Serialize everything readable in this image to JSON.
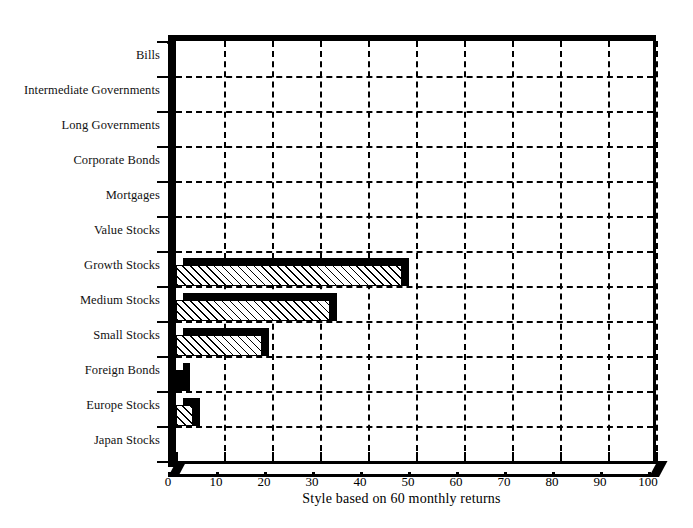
{
  "chart_data": {
    "type": "bar",
    "orientation": "horizontal",
    "title": "",
    "subtitle": "",
    "xlabel": "Style based on 60 monthly returns",
    "ylabel": "",
    "xlim": [
      0,
      100
    ],
    "xticks": [
      0,
      10,
      20,
      30,
      40,
      50,
      60,
      70,
      80,
      90,
      100
    ],
    "xticklabels": [
      "0",
      "10",
      "20",
      "30",
      "40",
      "50",
      "60",
      "70",
      "80",
      "90",
      "100"
    ],
    "grid": "both-dashed",
    "legend": "none",
    "categories": [
      "Bills",
      "Intermediate Governments",
      "Long Governments",
      "Corporate Bonds",
      "Mortgages",
      "Value Stocks",
      "Growth Stocks",
      "Medium Stocks",
      "Small Stocks",
      "Foreign Bonds",
      "Europe Stocks",
      "Japan Stocks"
    ],
    "values": [
      0,
      0,
      0,
      0,
      0,
      0,
      47,
      32,
      18,
      1.5,
      3.5,
      0
    ],
    "bar_styles": [
      "none",
      "none",
      "none",
      "none",
      "none",
      "none",
      "hatched",
      "hatched",
      "hatched",
      "solid",
      "hatched",
      "none"
    ],
    "colors": {
      "bar_fill": "#ffffff",
      "bar_hatch": "#000000",
      "bar_edge": "#000000",
      "bar_shadow": "#000000",
      "axis": "#000000",
      "grid": "#000000",
      "background": "#ffffff"
    }
  },
  "axis": {
    "x_title": "Style based on 60 monthly returns"
  }
}
